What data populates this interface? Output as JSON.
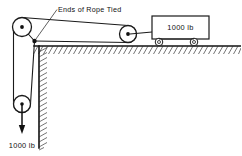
{
  "diagram": {
    "type": "pulley-system-free-body-diagram",
    "background_color": "#ffffff",
    "line_color": "#1a1a1a",
    "labels": {
      "rope_ends": "Ends of Rope Tied",
      "cart_weight": "1000 lb",
      "hanging_weight": "1000 lb"
    },
    "components": {
      "top_left_pulley": {
        "name": "top-left-pulley",
        "cx": 22,
        "cy": 27,
        "r": 9.5
      },
      "bottom_left_pulley": {
        "name": "bottom-left-pulley",
        "cx": 22,
        "cy": 104,
        "r": 8.5
      },
      "right_pulley": {
        "name": "right-pulley",
        "cx": 128,
        "cy": 34,
        "r": 8.5
      },
      "cart": {
        "name": "cart-block",
        "x": 152,
        "y": 16,
        "width": 57,
        "height": 23
      },
      "cart_wheel_left": {
        "cx": 159,
        "cy": 42,
        "r": 3.6
      },
      "cart_wheel_right": {
        "cx": 194,
        "cy": 42,
        "r": 3.6
      },
      "junction": {
        "name": "rope-tie-point",
        "x": 34,
        "y": 41
      },
      "ground_y": 46,
      "wall_x": 39,
      "wall_bottom": 148
    },
    "forces": {
      "hanging_load": {
        "label": "1000 lb",
        "direction": "down",
        "from_y": 104,
        "to_y": 133
      }
    }
  }
}
